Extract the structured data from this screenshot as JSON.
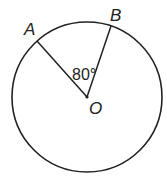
{
  "diagram": {
    "type": "circle-central-angle",
    "circle": {
      "center": "O",
      "cx": 87,
      "cy": 97,
      "r": 75
    },
    "points": [
      {
        "name": "A",
        "x": 37,
        "y": 41,
        "label_x": 24,
        "label_y": 35
      },
      {
        "name": "B",
        "x": 111,
        "y": 26,
        "label_x": 110,
        "label_y": 21
      },
      {
        "name": "O",
        "x": 87,
        "y": 97,
        "label_x": 89,
        "label_y": 114
      }
    ],
    "segments": [
      {
        "from": "O",
        "to": "A"
      },
      {
        "from": "O",
        "to": "B"
      }
    ],
    "angle": {
      "vertex": "O",
      "between": [
        "A",
        "B"
      ],
      "label": "80°",
      "label_x": 72,
      "label_y": 80
    },
    "colors": {
      "stroke": "#222222",
      "background": "#ffffff"
    }
  }
}
